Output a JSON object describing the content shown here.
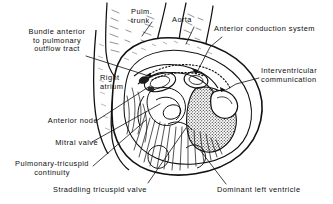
{
  "figure": {
    "kind": "anatomical-line-drawing",
    "ink_color": "#111111",
    "background_color": "#ffffff",
    "width": 333,
    "height": 204
  },
  "labels": [
    {
      "id": "bundle-anterior",
      "name": "label-bundle-anterior-to-pulmonary-outflow-tract",
      "lines": [
        "Bundle anterior",
        "to pulmonary",
        "outflow tract"
      ],
      "align": "center",
      "x": 14,
      "y": 28,
      "w": 86
    },
    {
      "id": "pulm-trunk",
      "name": "label-pulmonary-trunk",
      "lines": [
        "Pulm.",
        "trunk"
      ],
      "align": "left",
      "x": 131,
      "y": 8,
      "w": 34
    },
    {
      "id": "aorta",
      "name": "label-aorta",
      "lines": [
        "Aorta"
      ],
      "align": "left",
      "x": 172,
      "y": 16,
      "w": 34
    },
    {
      "id": "anterior-conduction",
      "name": "label-anterior-conduction-system",
      "lines": [
        "Anterior conduction system"
      ],
      "align": "left",
      "x": 214,
      "y": 25,
      "w": 118
    },
    {
      "id": "interventricular",
      "name": "label-interventricular-communication",
      "lines": [
        "Interventricular",
        "communication"
      ],
      "align": "left",
      "x": 261,
      "y": 67,
      "w": 70
    },
    {
      "id": "right-atrium",
      "name": "label-right-atrium",
      "lines": [
        "Right",
        "atrium"
      ],
      "align": "left",
      "x": 100,
      "y": 74,
      "w": 34
    },
    {
      "id": "anterior-node",
      "name": "label-anterior-node",
      "lines": [
        "Anterior node"
      ],
      "align": "right",
      "x": 12,
      "y": 117,
      "w": 86
    },
    {
      "id": "mitral-valve",
      "name": "label-mitral-valve",
      "lines": [
        "Mitral valve"
      ],
      "align": "right",
      "x": 12,
      "y": 139,
      "w": 86
    },
    {
      "id": "pulmonary-tricuspid",
      "name": "label-pulmonary-tricuspid-continuity",
      "lines": [
        "Pulmonary-tricuspid",
        "continuity"
      ],
      "align": "center",
      "x": 4,
      "y": 160,
      "w": 96
    },
    {
      "id": "straddling-tricuspid",
      "name": "label-straddling-tricuspid-valve",
      "lines": [
        "Straddling tricuspid valve"
      ],
      "align": "left",
      "x": 53,
      "y": 186,
      "w": 126
    },
    {
      "id": "dominant-left-ventricle",
      "name": "label-dominant-left-ventricle",
      "lines": [
        "Dominant left ventricle"
      ],
      "align": "left",
      "x": 217,
      "y": 186,
      "w": 114
    }
  ]
}
